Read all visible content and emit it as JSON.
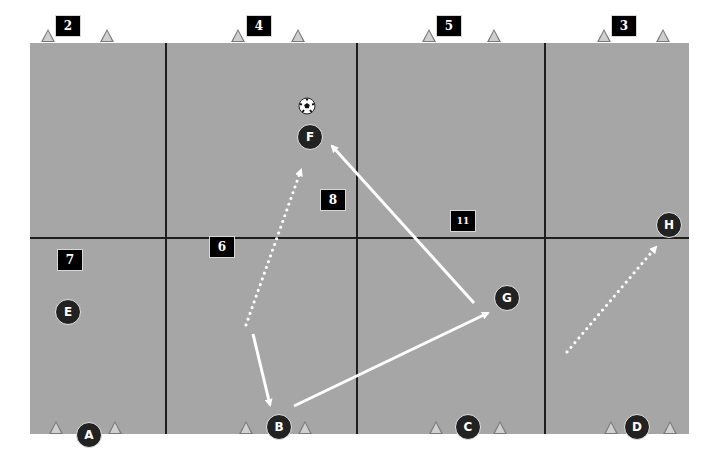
{
  "diagram": {
    "type": "soccer-drill",
    "field": {
      "color": "#a6a6a6",
      "line_color": "#1e1e1e",
      "columns": 4,
      "rows": 2
    },
    "zone_labels": [
      {
        "id": "z2",
        "text": "2",
        "x": 68,
        "y": 26
      },
      {
        "id": "z4",
        "text": "4",
        "x": 259,
        "y": 26
      },
      {
        "id": "z5",
        "text": "5",
        "x": 449,
        "y": 26
      },
      {
        "id": "z3",
        "text": "3",
        "x": 624,
        "y": 26
      },
      {
        "id": "z8",
        "text": "8",
        "x": 333,
        "y": 200
      },
      {
        "id": "z11",
        "text": "11",
        "x": 463,
        "y": 221
      },
      {
        "id": "z7",
        "text": "7",
        "x": 70,
        "y": 260
      },
      {
        "id": "z6",
        "text": "6",
        "x": 222,
        "y": 247
      }
    ],
    "players": [
      {
        "id": "A",
        "label": "A",
        "x": 89,
        "y": 435
      },
      {
        "id": "B",
        "label": "B",
        "x": 279,
        "y": 427
      },
      {
        "id": "C",
        "label": "C",
        "x": 468,
        "y": 427
      },
      {
        "id": "D",
        "label": "D",
        "x": 637,
        "y": 427
      },
      {
        "id": "E",
        "label": "E",
        "x": 68,
        "y": 312
      },
      {
        "id": "F",
        "label": "F",
        "x": 310,
        "y": 137
      },
      {
        "id": "G",
        "label": "G",
        "x": 507,
        "y": 298
      },
      {
        "id": "H",
        "label": "H",
        "x": 669,
        "y": 225
      }
    ],
    "cones": [
      {
        "x": 48,
        "y": 36
      },
      {
        "x": 107,
        "y": 36
      },
      {
        "x": 238,
        "y": 36
      },
      {
        "x": 298,
        "y": 36
      },
      {
        "x": 429,
        "y": 36
      },
      {
        "x": 494,
        "y": 36
      },
      {
        "x": 604,
        "y": 36
      },
      {
        "x": 663,
        "y": 36
      },
      {
        "x": 56,
        "y": 428
      },
      {
        "x": 115,
        "y": 428
      },
      {
        "x": 246,
        "y": 428
      },
      {
        "x": 305,
        "y": 428
      },
      {
        "x": 436,
        "y": 428
      },
      {
        "x": 500,
        "y": 428
      },
      {
        "x": 611,
        "y": 428
      },
      {
        "x": 670,
        "y": 428
      }
    ],
    "ball": {
      "icon": "soccer-ball-icon",
      "x": 307,
      "y": 106
    },
    "arrows": [
      {
        "id": "pass-g-to-f",
        "style": "solid",
        "x1": 474,
        "y1": 303,
        "x2": 332,
        "y2": 146
      },
      {
        "id": "pass-b-to-g",
        "style": "solid",
        "x1": 294,
        "y1": 406,
        "x2": 488,
        "y2": 313
      },
      {
        "id": "run-to-b",
        "style": "solid",
        "x1": 253,
        "y1": 334,
        "x2": 270,
        "y2": 405
      },
      {
        "id": "run-to-f",
        "style": "dotted",
        "x1": 246,
        "y1": 325,
        "x2": 301,
        "y2": 170
      },
      {
        "id": "run-to-h",
        "style": "dotted",
        "x1": 567,
        "y1": 352,
        "x2": 656,
        "y2": 247
      }
    ]
  }
}
